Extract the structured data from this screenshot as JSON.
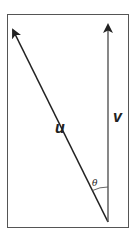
{
  "diagram": {
    "type": "vector-angle",
    "vectors": [
      {
        "name": "u",
        "label": "u",
        "tail": [
          108,
          222
        ],
        "head": [
          11,
          26
        ]
      },
      {
        "name": "v",
        "label": "v",
        "tail": [
          108,
          222
        ],
        "head": [
          108,
          22
        ]
      }
    ],
    "angle": {
      "label": "θ",
      "between": [
        "u",
        "v"
      ]
    },
    "colors": {
      "stroke": "#222222",
      "border": "#555555",
      "background": "#ffffff"
    }
  }
}
